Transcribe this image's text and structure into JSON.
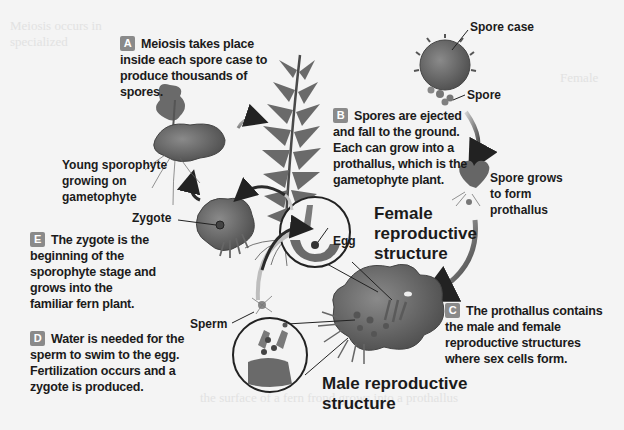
{
  "diagram": {
    "steps": [
      {
        "id": "A",
        "text": "Meiosis takes place inside each spore case to produce thousands of spores.",
        "lines": [
          "Meiosis takes place",
          "inside each spore case to",
          "produce thousands of spores."
        ]
      },
      {
        "id": "B",
        "text": "Spores are ejected and fall to the ground. Each can grow into a prothallus, which is the gametophyte plant.",
        "lines": [
          "Spores are ejected",
          "and fall to the ground.",
          "Each can grow into a",
          "prothallus, which is the",
          "gametophyte plant."
        ]
      },
      {
        "id": "C",
        "text": "The prothallus contains the male and female reproductive structures where sex cells form.",
        "lines": [
          "The prothallus contains",
          "the male and female",
          "reproductive structures",
          "where sex cells form."
        ]
      },
      {
        "id": "D",
        "text": "Water is needed for the sperm to swim to the egg. Fertilization occurs and a zygote is produced.",
        "lines": [
          "Water is needed for the",
          "sperm to swim to the egg.",
          "Fertilization occurs and a",
          "zygote is produced."
        ]
      },
      {
        "id": "E",
        "text": "The zygote is the beginning of the sporophyte stage and grows into the familiar fern plant.",
        "lines": [
          "The zygote is the",
          "beginning of the",
          "sporophyte stage and",
          "grows into the",
          "familiar fern plant."
        ]
      }
    ],
    "labels": {
      "spore_case": "Spore case",
      "spore": "Spore",
      "spore_grows": [
        "Spore grows",
        "to form",
        "prothallus"
      ],
      "young_sporophyte": [
        "Young sporophyte",
        "growing on",
        "gametophyte"
      ],
      "zygote": "Zygote",
      "egg": "Egg",
      "sperm": "Sperm",
      "female_structure": [
        "Female",
        "reproductive",
        "structure"
      ],
      "male_structure": [
        "Male reproductive",
        "structure"
      ]
    },
    "colors": {
      "badge": "#8a8a8a",
      "text": "#1b1b1b",
      "plant_dark": "#5a5a5a",
      "plant_mid": "#7a7a7a",
      "background": "#f4f4f4"
    }
  }
}
